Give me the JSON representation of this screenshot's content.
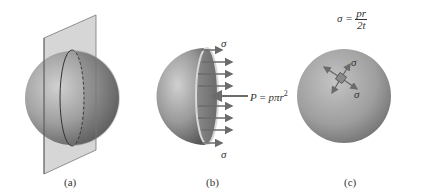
{
  "panels": [
    {
      "id": "a",
      "caption": "(a)"
    },
    {
      "id": "b",
      "caption": "(b)",
      "stress_top": "σ",
      "stress_bottom": "σ",
      "force_lhs": "P",
      "force_eq": " = ",
      "force_rhs": "pπr",
      "force_exp": "2"
    },
    {
      "id": "c",
      "caption": "(c)",
      "eq_lhs": "σ = ",
      "eq_num": "pr",
      "eq_den": "2t",
      "stress_upper": "σ",
      "stress_lower": "σ"
    }
  ],
  "colors": {
    "sphere_dark": "#5a5a5a",
    "sphere_light": "#c8c8c8",
    "plane": "#b9b9b9",
    "arrow": "#6b6b6b"
  }
}
